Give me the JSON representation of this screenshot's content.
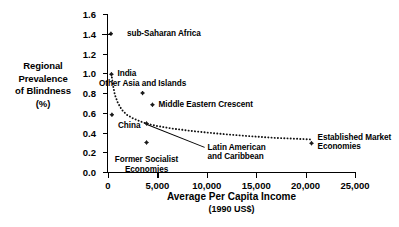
{
  "chart_data": {
    "type": "scatter",
    "title": "",
    "xlabel": "Average Per Capita Income",
    "xlabel_sub": "(1990 US$)",
    "ylabel_lines": [
      "Regional",
      "Prevalence",
      "of Blindness",
      "(%)"
    ],
    "xlim": [
      0,
      25000
    ],
    "ylim": [
      0.0,
      1.6
    ],
    "xticks": [
      0,
      5000,
      10000,
      15000,
      20000,
      25000
    ],
    "xtick_labels": [
      "0",
      "5,000",
      "10,000",
      "15,000",
      "20,000",
      "25,000"
    ],
    "yticks": [
      0.0,
      0.2,
      0.4,
      0.6,
      0.8,
      1.0,
      1.2,
      1.4,
      1.6
    ],
    "ytick_labels": [
      "0.0",
      "0.2",
      "0.4",
      "0.6",
      "0.8",
      "1.0",
      "1.2",
      "1.4",
      "1.6"
    ],
    "grid": false,
    "legend": "none",
    "points": [
      {
        "name": "sub-Saharan Africa",
        "label": "sub-Saharan Africa",
        "x": 300,
        "y": 1.4,
        "label_pos": "right",
        "label_dx": 16,
        "label_dy": 0,
        "leader": true
      },
      {
        "name": "India",
        "label": "India",
        "x": 350,
        "y": 0.99,
        "label_pos": "right",
        "label_dx": 6,
        "label_dy": 0,
        "leader": false
      },
      {
        "name": "China",
        "label": "China",
        "x": 400,
        "y": 0.58,
        "label_pos": "below",
        "label_dx": 6,
        "label_dy": 10,
        "leader": false
      },
      {
        "name": "Other Asia and Islands",
        "label": "Other Asia and Islands",
        "x": 3500,
        "y": 0.8,
        "label_pos": "above",
        "label_dx": 0,
        "label_dy": -10,
        "leader": false
      },
      {
        "name": "Middle Eastern Crescent",
        "label": "Middle Eastern Crescent",
        "x": 4500,
        "y": 0.68,
        "label_pos": "right",
        "label_dx": 6,
        "label_dy": 0,
        "leader": false
      },
      {
        "name": "Latin American and Caribbean",
        "label": "Latin American\nand Caribbean",
        "x": 3900,
        "y": 0.49,
        "label_pos": "leader",
        "label_dx": 61,
        "label_dy": 29,
        "leader": true
      },
      {
        "name": "Former Socialist Economies",
        "label": "Former Socialist\nEconomies",
        "x": 3900,
        "y": 0.3,
        "label_pos": "below",
        "label_dx": 0,
        "label_dy": 13,
        "leader": false
      },
      {
        "name": "Established Market Economies",
        "label": "Established Market\nEconomies",
        "x": 20600,
        "y": 0.29,
        "label_pos": "right",
        "label_dx": 6,
        "label_dy": -0.5,
        "leader": false
      }
    ],
    "trend_curve": {
      "style": "dotted",
      "description": "Fitted declining curve through the regional points",
      "x": [
        350,
        500,
        700,
        1000,
        1400,
        1900,
        2500,
        3200,
        3900,
        5000,
        6500,
        8500,
        11000,
        14000,
        17000,
        20600
      ],
      "y": [
        0.99,
        0.88,
        0.78,
        0.7,
        0.63,
        0.58,
        0.545,
        0.515,
        0.49,
        0.465,
        0.44,
        0.415,
        0.39,
        0.365,
        0.345,
        0.33
      ]
    },
    "colors": {
      "axis": "#000000",
      "marker": "#1a1a1a",
      "text": "#000000",
      "background": "#ffffff"
    }
  }
}
